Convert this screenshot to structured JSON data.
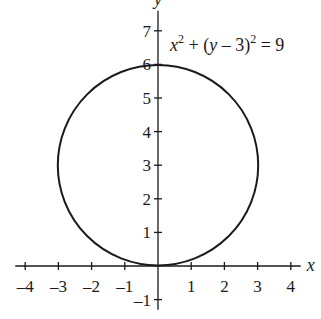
{
  "chart_data": {
    "type": "line",
    "title": "",
    "equation": "x^2 + (y - 3)^2 = 9",
    "equation_parts": {
      "x": "x",
      "sup1": "2",
      "mid": " + (",
      "y": "y",
      "rest": " – 3)",
      "sup2": "2",
      "end": " = 9"
    },
    "shape": {
      "kind": "circle",
      "center": [
        0,
        3
      ],
      "radius": 3
    },
    "xlabel": "x",
    "ylabel": "y",
    "xlim": [
      -4.3,
      4.3
    ],
    "ylim": [
      -1.3,
      7.6
    ],
    "x_ticks": [
      -4,
      -3,
      -2,
      -1,
      1,
      2,
      3,
      4
    ],
    "x_tick_labels": [
      "–4",
      "–3",
      "–2",
      "–1",
      "1",
      "2",
      "3",
      "4"
    ],
    "y_ticks": [
      -1,
      1,
      2,
      3,
      4,
      5,
      6,
      7
    ],
    "y_tick_labels": [
      "–1",
      "1",
      "2",
      "3",
      "4",
      "5",
      "6",
      "7"
    ],
    "grid": false,
    "legend": null,
    "line_color": "#1a1a1a"
  }
}
